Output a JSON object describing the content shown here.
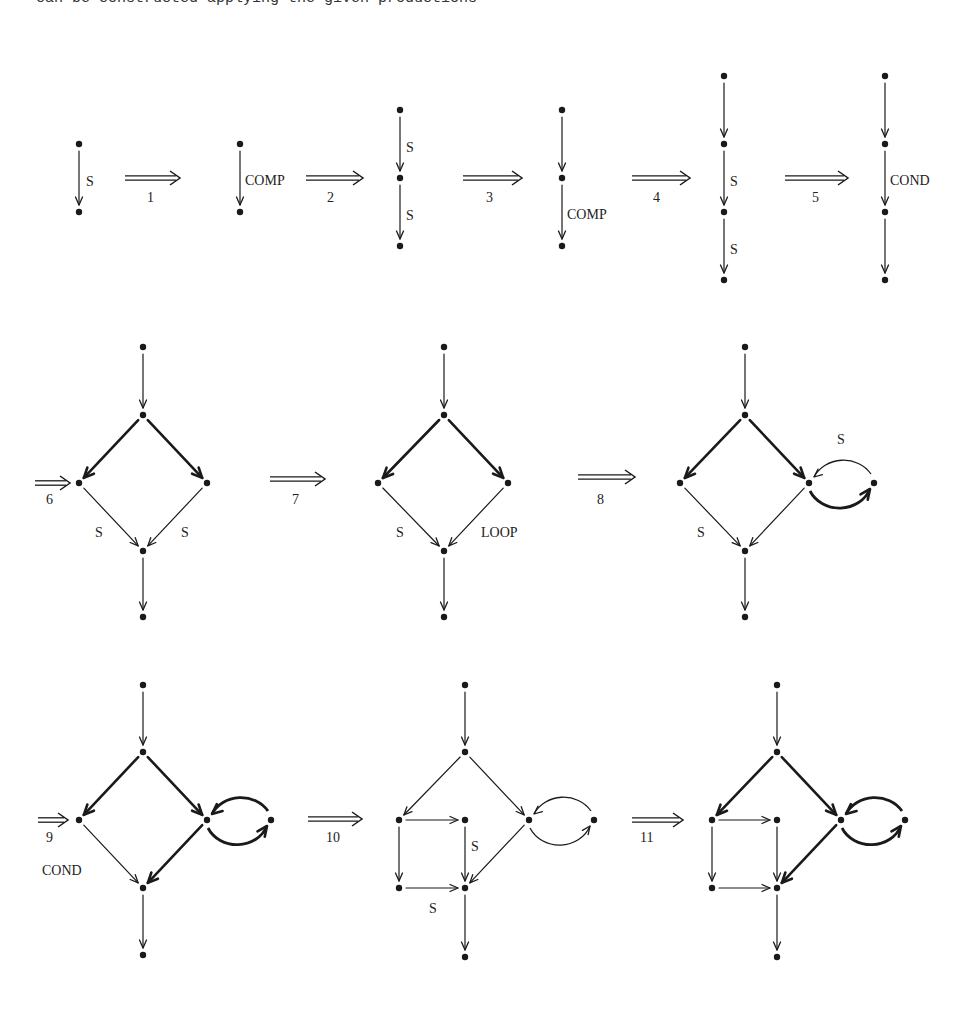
{
  "caption": "can be constructed applying the given productions",
  "colors": {
    "ink": "#1a1a1a",
    "background": "#ffffff"
  },
  "productions": [
    {
      "step": "1",
      "label": "1"
    },
    {
      "step": "2",
      "label": "2"
    },
    {
      "step": "3",
      "label": "3"
    },
    {
      "step": "4",
      "label": "4"
    },
    {
      "step": "5",
      "label": "5"
    },
    {
      "step": "6",
      "label": "6"
    },
    {
      "step": "7",
      "label": "7"
    },
    {
      "step": "8",
      "label": "8"
    },
    {
      "step": "9",
      "label": "9"
    },
    {
      "step": "10",
      "label": "10"
    },
    {
      "step": "11",
      "label": "11"
    }
  ],
  "diagrams": [
    {
      "id": "g0",
      "nodes": [
        [
          79,
          144
        ],
        [
          79,
          212
        ]
      ],
      "edges": [
        {
          "from": 0,
          "to": 1,
          "thick": false
        }
      ],
      "labels": [
        {
          "text": "S",
          "x": 86,
          "y": 186
        }
      ]
    },
    {
      "id": "g1",
      "nodes": [
        [
          240,
          144
        ],
        [
          240,
          212
        ]
      ],
      "edges": [
        {
          "from": 0,
          "to": 1,
          "thick": false
        }
      ],
      "labels": [
        {
          "text": "COMP",
          "x": 245,
          "y": 185
        }
      ]
    },
    {
      "id": "g2",
      "nodes": [
        [
          400,
          110
        ],
        [
          400,
          178
        ],
        [
          400,
          246
        ]
      ],
      "edges": [
        {
          "from": 0,
          "to": 1,
          "thick": false
        },
        {
          "from": 1,
          "to": 2,
          "thick": false
        }
      ],
      "labels": [
        {
          "text": "S",
          "x": 406,
          "y": 152
        },
        {
          "text": "S",
          "x": 406,
          "y": 220
        }
      ]
    },
    {
      "id": "g3",
      "nodes": [
        [
          562,
          110
        ],
        [
          562,
          178
        ],
        [
          562,
          246
        ]
      ],
      "edges": [
        {
          "from": 0,
          "to": 1,
          "thick": false
        },
        {
          "from": 1,
          "to": 2,
          "thick": false
        }
      ],
      "labels": [
        {
          "text": "COMP",
          "x": 567,
          "y": 219
        }
      ]
    },
    {
      "id": "g4",
      "nodes": [
        [
          724,
          76
        ],
        [
          724,
          144
        ],
        [
          724,
          212
        ],
        [
          724,
          280
        ]
      ],
      "edges": [
        {
          "from": 0,
          "to": 1,
          "thick": false
        },
        {
          "from": 1,
          "to": 2,
          "thick": false
        },
        {
          "from": 2,
          "to": 3,
          "thick": false
        }
      ],
      "labels": [
        {
          "text": "S",
          "x": 730,
          "y": 186
        },
        {
          "text": "S",
          "x": 730,
          "y": 254
        }
      ]
    },
    {
      "id": "g5",
      "nodes": [
        [
          885,
          76
        ],
        [
          885,
          144
        ],
        [
          885,
          212
        ],
        [
          885,
          280
        ]
      ],
      "edges": [
        {
          "from": 0,
          "to": 1,
          "thick": false
        },
        {
          "from": 1,
          "to": 2,
          "thick": false
        },
        {
          "from": 2,
          "to": 3,
          "thick": false
        }
      ],
      "labels": [
        {
          "text": "COND",
          "x": 890,
          "y": 185
        }
      ]
    },
    {
      "id": "g6",
      "nodes": [
        [
          143,
          347
        ],
        [
          143,
          415
        ],
        [
          79,
          483
        ],
        [
          207,
          483
        ],
        [
          143,
          551
        ],
        [
          143,
          617
        ]
      ],
      "edges": [
        {
          "from": 0,
          "to": 1,
          "thick": false
        },
        {
          "from": 1,
          "to": 2,
          "thick": true
        },
        {
          "from": 1,
          "to": 3,
          "thick": true
        },
        {
          "from": 2,
          "to": 4,
          "thick": false
        },
        {
          "from": 3,
          "to": 4,
          "thick": false
        },
        {
          "from": 4,
          "to": 5,
          "thick": false
        }
      ],
      "labels": [
        {
          "text": "S",
          "x": 95,
          "y": 537
        },
        {
          "text": "S",
          "x": 181,
          "y": 537
        }
      ]
    },
    {
      "id": "g7",
      "nodes": [
        [
          444,
          347
        ],
        [
          444,
          415
        ],
        [
          378,
          483
        ],
        [
          508,
          483
        ],
        [
          444,
          551
        ],
        [
          444,
          617
        ]
      ],
      "edges": [
        {
          "from": 0,
          "to": 1,
          "thick": false
        },
        {
          "from": 1,
          "to": 2,
          "thick": true
        },
        {
          "from": 1,
          "to": 3,
          "thick": true
        },
        {
          "from": 2,
          "to": 4,
          "thick": false
        },
        {
          "from": 3,
          "to": 4,
          "thick": false
        },
        {
          "from": 4,
          "to": 5,
          "thick": false
        }
      ],
      "labels": [
        {
          "text": "S",
          "x": 396,
          "y": 537
        },
        {
          "text": "LOOP",
          "x": 481,
          "y": 537
        }
      ]
    },
    {
      "id": "g8",
      "nodes": [
        [
          745,
          347
        ],
        [
          745,
          415
        ],
        [
          680,
          483
        ],
        [
          809,
          483
        ],
        [
          874,
          483
        ],
        [
          745,
          551
        ],
        [
          745,
          617
        ]
      ],
      "edges": [
        {
          "from": 0,
          "to": 1,
          "thick": false
        },
        {
          "from": 1,
          "to": 2,
          "thick": true
        },
        {
          "from": 1,
          "to": 3,
          "thick": true
        },
        {
          "from": 2,
          "to": 5,
          "thick": false
        },
        {
          "from": 3,
          "to": 5,
          "thick": false
        },
        {
          "from": 5,
          "to": 6,
          "thick": false
        }
      ],
      "loops": [
        {
          "a": 3,
          "b": 4,
          "upper_thick": false,
          "lower_thick": true
        }
      ],
      "labels": [
        {
          "text": "S",
          "x": 697,
          "y": 537
        },
        {
          "text": "S",
          "x": 837,
          "y": 444
        }
      ]
    },
    {
      "id": "g9",
      "nodes": [
        [
          143,
          685
        ],
        [
          143,
          752
        ],
        [
          79,
          820
        ],
        [
          207,
          820
        ],
        [
          271,
          820
        ],
        [
          143,
          888
        ],
        [
          143,
          955
        ]
      ],
      "edges": [
        {
          "from": 0,
          "to": 1,
          "thick": false
        },
        {
          "from": 1,
          "to": 2,
          "thick": true
        },
        {
          "from": 1,
          "to": 3,
          "thick": true
        },
        {
          "from": 2,
          "to": 5,
          "thick": false
        },
        {
          "from": 3,
          "to": 5,
          "thick": true
        },
        {
          "from": 5,
          "to": 6,
          "thick": false
        }
      ],
      "loops": [
        {
          "a": 3,
          "b": 4,
          "upper_thick": true,
          "lower_thick": true
        }
      ],
      "labels": [
        {
          "text": "COND",
          "x": 42,
          "y": 875
        }
      ]
    },
    {
      "id": "g10",
      "nodes": [
        [
          465,
          685
        ],
        [
          465,
          752
        ],
        [
          399,
          820
        ],
        [
          465,
          820
        ],
        [
          529,
          820
        ],
        [
          594,
          820
        ],
        [
          399,
          888
        ],
        [
          465,
          888
        ],
        [
          465,
          957
        ]
      ],
      "edges": [
        {
          "from": 0,
          "to": 1,
          "thick": false
        },
        {
          "from": 1,
          "to": 2,
          "thick": false
        },
        {
          "from": 1,
          "to": 4,
          "thick": false
        },
        {
          "from": 2,
          "to": 3,
          "thick": false
        },
        {
          "from": 2,
          "to": 6,
          "thick": false
        },
        {
          "from": 3,
          "to": 7,
          "thick": false
        },
        {
          "from": 6,
          "to": 7,
          "thick": false
        },
        {
          "from": 4,
          "to": 7,
          "thick": false
        },
        {
          "from": 7,
          "to": 8,
          "thick": false
        }
      ],
      "loops": [
        {
          "a": 4,
          "b": 5,
          "upper_thick": false,
          "lower_thick": false
        }
      ],
      "labels": [
        {
          "text": "S",
          "x": 471,
          "y": 851
        },
        {
          "text": "S",
          "x": 429,
          "y": 913
        }
      ]
    },
    {
      "id": "g11",
      "nodes": [
        [
          777,
          685
        ],
        [
          777,
          752
        ],
        [
          712,
          820
        ],
        [
          777,
          820
        ],
        [
          841,
          820
        ],
        [
          905,
          820
        ],
        [
          712,
          888
        ],
        [
          777,
          888
        ],
        [
          777,
          957
        ]
      ],
      "edges": [
        {
          "from": 0,
          "to": 1,
          "thick": false
        },
        {
          "from": 1,
          "to": 2,
          "thick": true
        },
        {
          "from": 1,
          "to": 4,
          "thick": true
        },
        {
          "from": 2,
          "to": 3,
          "thick": false
        },
        {
          "from": 2,
          "to": 6,
          "thick": false
        },
        {
          "from": 3,
          "to": 7,
          "thick": false
        },
        {
          "from": 6,
          "to": 7,
          "thick": false
        },
        {
          "from": 4,
          "to": 7,
          "thick": true
        },
        {
          "from": 7,
          "to": 8,
          "thick": false
        }
      ],
      "loops": [
        {
          "a": 4,
          "b": 5,
          "upper_thick": true,
          "lower_thick": true
        }
      ],
      "labels": []
    }
  ],
  "production_arrows": [
    {
      "step": 0,
      "x1": 125,
      "x2": 180,
      "y": 178,
      "lx": 147,
      "ly": 202
    },
    {
      "step": 1,
      "x1": 306,
      "x2": 363,
      "y": 178,
      "lx": 327,
      "ly": 202
    },
    {
      "step": 2,
      "x1": 463,
      "x2": 522,
      "y": 178,
      "lx": 486,
      "ly": 202
    },
    {
      "step": 3,
      "x1": 632,
      "x2": 690,
      "y": 178,
      "lx": 653,
      "ly": 202
    },
    {
      "step": 4,
      "x1": 785,
      "x2": 848,
      "y": 178,
      "lx": 812,
      "ly": 202
    },
    {
      "step": 5,
      "x1": 35,
      "x2": 70,
      "y": 483,
      "lx": 46,
      "ly": 504
    },
    {
      "step": 6,
      "x1": 270,
      "x2": 325,
      "y": 479,
      "lx": 292,
      "ly": 504
    },
    {
      "step": 7,
      "x1": 578,
      "x2": 635,
      "y": 477,
      "lx": 597,
      "ly": 504
    },
    {
      "step": 8,
      "x1": 38,
      "x2": 68,
      "y": 820,
      "lx": 46,
      "ly": 842
    },
    {
      "step": 9,
      "x1": 308,
      "x2": 362,
      "y": 819,
      "lx": 326,
      "ly": 842
    },
    {
      "step": 10,
      "x1": 632,
      "x2": 683,
      "y": 820,
      "lx": 640,
      "ly": 842
    }
  ]
}
